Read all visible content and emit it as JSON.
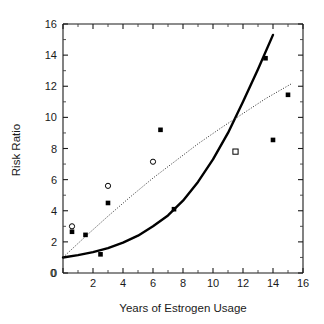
{
  "chart_data": {
    "type": "scatter",
    "title": "",
    "xlabel": "Years of Estrogen Usage",
    "ylabel": "Risk Ratio",
    "xlim": [
      0,
      16
    ],
    "ylim": [
      0,
      16
    ],
    "xticks": [
      0,
      2,
      4,
      6,
      8,
      10,
      12,
      14,
      16
    ],
    "yticks": [
      0,
      2,
      4,
      6,
      8,
      10,
      12,
      14,
      16
    ],
    "xtick_labels": [
      "0",
      "2",
      "4",
      "6",
      "8",
      "10",
      "12",
      "14",
      "16"
    ],
    "ytick_labels": [
      "0",
      "2",
      "4",
      "6",
      "8",
      "10",
      "12",
      "14",
      "16"
    ],
    "xminor_ticks": [
      1,
      3,
      5,
      7,
      9,
      11,
      13,
      15
    ],
    "yminor_ticks": [
      1,
      3,
      5,
      7,
      9,
      11,
      13,
      15
    ],
    "grid": false,
    "legend": null,
    "series": [
      {
        "name": "Filled squares",
        "marker": "filled-square",
        "color": "#000000",
        "points": [
          {
            "x": 0.6,
            "y": 2.65
          },
          {
            "x": 1.5,
            "y": 2.45
          },
          {
            "x": 2.5,
            "y": 1.2
          },
          {
            "x": 3.0,
            "y": 4.5
          },
          {
            "x": 6.5,
            "y": 9.2
          },
          {
            "x": 7.4,
            "y": 4.1
          },
          {
            "x": 13.5,
            "y": 13.8
          },
          {
            "x": 14.0,
            "y": 8.55
          },
          {
            "x": 15.0,
            "y": 11.45
          }
        ]
      },
      {
        "name": "Open circles",
        "marker": "open-circle",
        "color": "#000000",
        "points": [
          {
            "x": 0.6,
            "y": 3.0
          },
          {
            "x": 3.0,
            "y": 5.6
          },
          {
            "x": 6.0,
            "y": 7.15
          }
        ]
      },
      {
        "name": "Open square",
        "marker": "open-square",
        "color": "#000000",
        "points": [
          {
            "x": 11.5,
            "y": 7.8
          }
        ]
      }
    ],
    "fitted_curves": [
      {
        "name": "Exponential fit (solid)",
        "style": "solid",
        "color": "#000000",
        "x_range": [
          0.0,
          14.0
        ],
        "points": [
          {
            "x": 0.0,
            "y": 1.0
          },
          {
            "x": 1.0,
            "y": 1.15
          },
          {
            "x": 2.0,
            "y": 1.34
          },
          {
            "x": 3.0,
            "y": 1.6
          },
          {
            "x": 4.0,
            "y": 1.95
          },
          {
            "x": 5.0,
            "y": 2.4
          },
          {
            "x": 6.0,
            "y": 3.0
          },
          {
            "x": 7.0,
            "y": 3.7
          },
          {
            "x": 8.0,
            "y": 4.65
          },
          {
            "x": 9.0,
            "y": 5.85
          },
          {
            "x": 10.0,
            "y": 7.3
          },
          {
            "x": 11.0,
            "y": 9.0
          },
          {
            "x": 12.0,
            "y": 11.0
          },
          {
            "x": 13.0,
            "y": 13.1
          },
          {
            "x": 14.0,
            "y": 15.3
          }
        ]
      },
      {
        "name": "Linear-ish fit (dotted)",
        "style": "dotted",
        "color": "#2b2b2b",
        "x_range": [
          0.0,
          15.3
        ],
        "points": [
          {
            "x": 0.0,
            "y": 1.0
          },
          {
            "x": 1.5,
            "y": 2.35
          },
          {
            "x": 3.0,
            "y": 3.65
          },
          {
            "x": 4.5,
            "y": 4.9
          },
          {
            "x": 6.0,
            "y": 6.1
          },
          {
            "x": 7.5,
            "y": 7.2
          },
          {
            "x": 9.0,
            "y": 8.3
          },
          {
            "x": 10.5,
            "y": 9.3
          },
          {
            "x": 12.0,
            "y": 10.25
          },
          {
            "x": 13.5,
            "y": 11.2
          },
          {
            "x": 15.3,
            "y": 12.2
          }
        ]
      }
    ]
  },
  "axes": {
    "x_title": "Years of Estrogen Usage",
    "y_title": "Risk Ratio"
  }
}
